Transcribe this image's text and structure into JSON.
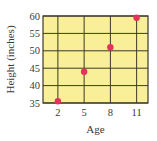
{
  "chart_data": {
    "type": "scatter",
    "title": "",
    "xlabel": "Age",
    "ylabel": "Height (inches)",
    "x": [
      2,
      5,
      8,
      11
    ],
    "y": [
      35.5,
      44,
      51,
      59.5
    ],
    "series": [
      {
        "name": "Height",
        "x": [
          2,
          5,
          8,
          11
        ],
        "values": [
          35.5,
          44,
          51,
          59.5
        ]
      }
    ],
    "xticks": [
      2,
      5,
      8,
      11
    ],
    "yticks": [
      35,
      40,
      45,
      50,
      55,
      60
    ],
    "xlim": [
      0.3,
      12.3
    ],
    "ylim": [
      35,
      60
    ],
    "grid": true,
    "legend": null
  },
  "colors": {
    "plot_background": "#f9ef98",
    "grid": "#3b3a2a",
    "frame": "#3b3a2a",
    "marker": "#e8305a",
    "text": "#3a3a3a"
  }
}
